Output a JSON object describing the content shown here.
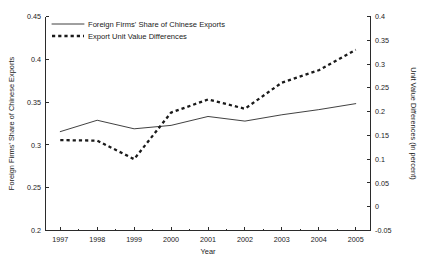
{
  "chart_data": {
    "type": "line",
    "title": "",
    "xlabel": "Year",
    "ylabel": "Foreign Firms' Share of Chinese Exports",
    "y2label": "Unit Value Differences (in percent)",
    "grid": false,
    "legend_position": "top-left",
    "xlim": [
      1996.6,
      2005.4
    ],
    "ylim": [
      0.2,
      0.45
    ],
    "y2lim": [
      -0.05,
      0.4
    ],
    "xticks": [
      1997,
      1998,
      1999,
      2000,
      2001,
      2002,
      2003,
      2004,
      2005
    ],
    "xticklabels": [
      "1997",
      "1998",
      "1999",
      "2000",
      "2001",
      "2002",
      "2003",
      "2004",
      "2005"
    ],
    "yticks": [
      0.2,
      0.25,
      0.3,
      0.35,
      0.4,
      0.45
    ],
    "yticklabels": [
      "0.2",
      "0.25",
      "0.3",
      "0.35",
      "0.4",
      "0.45"
    ],
    "y2ticks": [
      -0.05,
      0,
      0.05,
      0.1,
      0.15,
      0.2,
      0.25,
      0.3,
      0.35,
      0.4
    ],
    "y2ticklabels": [
      "-0.05",
      "0",
      "0.05",
      "0.1",
      "0.15",
      "0.2",
      "0.25",
      "0.3",
      "0.35",
      "0.4"
    ],
    "x": [
      1997,
      1998,
      1999,
      2000,
      2001,
      2002,
      2003,
      2004,
      2005
    ],
    "series": [
      {
        "name": "Foreign Firms' Share of Chinese Exports",
        "axis": "left",
        "style": "solid",
        "values": [
          0.3155,
          0.3288,
          0.3188,
          0.3228,
          0.3332,
          0.3278,
          0.3352,
          0.3412,
          0.3482
        ]
      },
      {
        "name": "Export Unit Value Differences",
        "axis": "right",
        "style": "dashed",
        "values": [
          0.14,
          0.139,
          0.1,
          0.198,
          0.2255,
          0.206,
          0.261,
          0.287,
          0.33
        ]
      }
    ],
    "legend": [
      {
        "label": "Foreign Firms' Share of Chinese Exports",
        "style": "solid"
      },
      {
        "label": "Export Unit Value Differences",
        "style": "dashed"
      }
    ]
  }
}
